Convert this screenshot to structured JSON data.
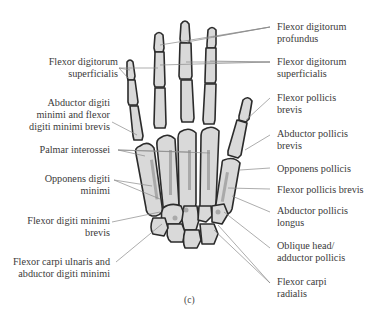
{
  "figure": {
    "caption": "(c)",
    "colors": {
      "bone_fill": "#d9d9d9",
      "bone_outline": "#2b2b2b",
      "attachment_shade": "#9a9a9a",
      "leader_line": "#8a8a8a",
      "text": "#3a3a3a"
    }
  },
  "labels_left": [
    {
      "id": "fds-left",
      "lines": [
        "Flexor digitorum",
        "superficialis"
      ]
    },
    {
      "id": "adm-fdmb",
      "lines": [
        "Abductor digiti",
        "minimi and flexor",
        "digiti minimi brevis"
      ]
    },
    {
      "id": "palmar-interossei",
      "lines": [
        "Palmar interossei"
      ]
    },
    {
      "id": "opponens-digiti-minimi",
      "lines": [
        "Opponens digiti",
        "minimi"
      ]
    },
    {
      "id": "fdmb",
      "lines": [
        "Flexor digiti minimi",
        "brevis"
      ]
    },
    {
      "id": "fcu-adm",
      "lines": [
        "Flexor carpi ulnaris and",
        "abductor digiti minimi"
      ]
    }
  ],
  "labels_right": [
    {
      "id": "fdp",
      "lines": [
        "Flexor digitorum",
        "profundus"
      ]
    },
    {
      "id": "fds-right",
      "lines": [
        "Flexor digitorum",
        "superficialis"
      ]
    },
    {
      "id": "fpb-1",
      "lines": [
        "Flexor pollicis",
        "brevis"
      ]
    },
    {
      "id": "apb",
      "lines": [
        "Abductor pollicis",
        "brevis"
      ]
    },
    {
      "id": "opponens-pollicis",
      "lines": [
        "Opponens pollicis"
      ]
    },
    {
      "id": "fpb-2",
      "lines": [
        "Flexor pollicis brevis"
      ]
    },
    {
      "id": "apl",
      "lines": [
        "Abductor pollicis",
        "longus"
      ]
    },
    {
      "id": "oblique-adductor",
      "lines": [
        "Oblique head/",
        "adductor pollicis"
      ]
    },
    {
      "id": "fcr",
      "lines": [
        "Flexor carpi",
        "radialis"
      ]
    }
  ]
}
